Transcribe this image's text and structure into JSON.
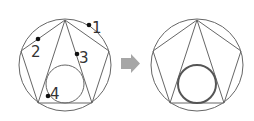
{
  "diagram": {
    "left_figure": {
      "labels": [
        "1",
        "2",
        "3",
        "4"
      ]
    },
    "right_figure": {},
    "arrow": {
      "color": "#a6a6a6"
    }
  },
  "colors": {
    "line": "#555555",
    "dot": "#111111",
    "highlight_circle": "#555555",
    "arrow": "#a6a6a6"
  }
}
